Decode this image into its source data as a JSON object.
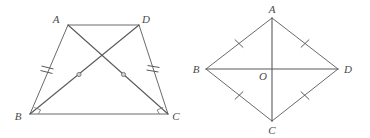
{
  "canvas": {
    "width": 370,
    "height": 138,
    "background": "#ffffff",
    "line_color": "#6a6a6a",
    "label_color": "#4a4a4a",
    "mark_color": "#787878"
  },
  "figures": [
    {
      "id": "left-figure",
      "name": "trapezoid-with-diagonals",
      "shape": "trapezoid",
      "vertices": [
        {
          "id": "A",
          "label": "A",
          "x": 68,
          "y": 25,
          "label_x": 56,
          "label_y": 23
        },
        {
          "id": "D",
          "label": "D",
          "x": 139,
          "y": 25,
          "label_x": 143,
          "label_y": 23
        },
        {
          "id": "B",
          "label": "B",
          "x": 30,
          "y": 114,
          "label_x": 17,
          "label_y": 118
        },
        {
          "id": "C",
          "label": "C",
          "x": 168,
          "y": 114,
          "label_x": 172,
          "label_y": 118
        }
      ],
      "sides": [
        {
          "name": "side-AD",
          "from": "A",
          "to": "D",
          "ticks": 0
        },
        {
          "name": "side-AB",
          "from": "A",
          "to": "B",
          "ticks": 2
        },
        {
          "name": "side-DC",
          "from": "D",
          "to": "C",
          "ticks": 2
        },
        {
          "name": "side-BC",
          "from": "B",
          "to": "C",
          "ticks": 0
        }
      ],
      "diagonals": [
        {
          "name": "diagonal-AC",
          "from": "A",
          "to": "C",
          "marker": "circle-dot"
        },
        {
          "name": "diagonal-DB",
          "from": "D",
          "to": "B",
          "marker": "circle-dot"
        }
      ],
      "angle_marks": [
        {
          "name": "angle-mark-B",
          "at": "B",
          "style": "square"
        },
        {
          "name": "angle-mark-C",
          "at": "C",
          "style": "square"
        }
      ]
    },
    {
      "id": "right-figure",
      "name": "rhombus-with-diagonals",
      "shape": "rhombus",
      "vertices": [
        {
          "id": "A",
          "label": "A",
          "x": 272,
          "y": 18,
          "label_x": 268,
          "label_y": 13
        },
        {
          "id": "B",
          "label": "B",
          "x": 206,
          "y": 69,
          "label_x": 194,
          "label_y": 72
        },
        {
          "id": "C",
          "label": "C",
          "x": 272,
          "y": 121,
          "label_x": 268,
          "label_y": 134
        },
        {
          "id": "D",
          "label": "D",
          "x": 338,
          "y": 69,
          "label_x": 343,
          "label_y": 72
        },
        {
          "id": "O",
          "label": "O",
          "x": 272,
          "y": 69,
          "label_x": 262,
          "label_y": 79
        }
      ],
      "sides": [
        {
          "name": "side-AB",
          "from": "A",
          "to": "B",
          "ticks": 1
        },
        {
          "name": "side-AD",
          "from": "A",
          "to": "D",
          "ticks": 1
        },
        {
          "name": "side-BC",
          "from": "B",
          "to": "C",
          "ticks": 1
        },
        {
          "name": "side-DC",
          "from": "D",
          "to": "C",
          "ticks": 1
        }
      ],
      "diagonals": [
        {
          "name": "diagonal-AC",
          "from": "A",
          "to": "C",
          "marker": "none"
        },
        {
          "name": "diagonal-BD",
          "from": "B",
          "to": "D",
          "marker": "none"
        }
      ],
      "center_label": "O"
    }
  ],
  "labels": {
    "left": {
      "A": "A",
      "B": "B",
      "C": "C",
      "D": "D"
    },
    "right": {
      "A": "A",
      "B": "B",
      "C": "C",
      "D": "D",
      "O": "O"
    }
  }
}
